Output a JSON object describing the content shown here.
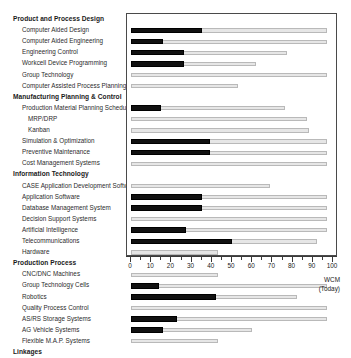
{
  "chart_data": {
    "type": "bar",
    "title": "",
    "xlabel": "WCM (Today)",
    "ylabel": "",
    "xlim": [
      0,
      100
    ],
    "grid": false,
    "legend": "none",
    "axis": {
      "major_ticks": [
        0,
        10,
        20,
        30,
        40,
        50,
        60,
        70,
        80,
        90,
        100
      ],
      "minor_tick_step": 5,
      "tick_labels": [
        "0",
        "10",
        "20",
        "30",
        "40",
        "50",
        "60",
        "70",
        "80",
        "90",
        "100"
      ]
    },
    "series": [
      {
        "name": "current",
        "color": "#111111"
      },
      {
        "name": "target",
        "color": "#e6e6e6"
      }
    ],
    "groups": [
      {
        "label": "Product and Process Design",
        "level": "header",
        "current": null,
        "target": null
      },
      {
        "label": "Computer Aided Design",
        "level": "sub",
        "current": 35,
        "target": 97
      },
      {
        "label": "Computer Aided Engineering",
        "level": "sub",
        "current": 16,
        "target": 97
      },
      {
        "label": "Engineering Control",
        "level": "sub",
        "current": 26,
        "target": 77
      },
      {
        "label": "Workcell Device Programming",
        "level": "sub",
        "current": 26,
        "target": 62
      },
      {
        "label": "Group Technology",
        "level": "sub",
        "current": 0,
        "target": 97
      },
      {
        "label": "Computer Assisted Process Planning",
        "level": "sub",
        "current": 0,
        "target": 53
      },
      {
        "label": "Manufacturing Planning & Control",
        "level": "header",
        "current": null,
        "target": null
      },
      {
        "label": "Production Material Planning Scheduling",
        "level": "sub",
        "current": 15,
        "target": 76
      },
      {
        "label": "MRP/DRP",
        "level": "sub2",
        "current": 0,
        "target": 87
      },
      {
        "label": "Kanban",
        "level": "sub2",
        "current": 0,
        "target": 88
      },
      {
        "label": "Simulation & Optimization",
        "level": "sub",
        "current": 39,
        "target": 97
      },
      {
        "label": "Preventive Maintenance",
        "level": "sub",
        "current": 39,
        "target": 97
      },
      {
        "label": "Cost Management Systems",
        "level": "sub",
        "current": 0,
        "target": 97
      },
      {
        "label": "Information Technology",
        "level": "header",
        "current": null,
        "target": null
      },
      {
        "label": "CASE Application Development Software",
        "level": "sub",
        "current": 0,
        "target": 69
      },
      {
        "label": "Application Software",
        "level": "sub",
        "current": 35,
        "target": 97
      },
      {
        "label": "Database Management System",
        "level": "sub",
        "current": 35,
        "target": 97
      },
      {
        "label": "Decision Support Systems",
        "level": "sub",
        "current": 0,
        "target": 97
      },
      {
        "label": "Artificial Intelligence",
        "level": "sub",
        "current": 27,
        "target": 97
      },
      {
        "label": "Telecommunications",
        "level": "sub",
        "current": 50,
        "target": 92
      },
      {
        "label": "Hardware",
        "level": "sub",
        "current": 0,
        "target": 43
      },
      {
        "label": "Production Process",
        "level": "header",
        "current": null,
        "target": null
      },
      {
        "label": "CNC/DNC Machines",
        "level": "sub",
        "current": 0,
        "target": 43
      },
      {
        "label": "Group Technology Cells",
        "level": "sub",
        "current": 14,
        "target": 97
      },
      {
        "label": "Robotics",
        "level": "sub",
        "current": 42,
        "target": 82
      },
      {
        "label": "Quality Process Control",
        "level": "sub",
        "current": 0,
        "target": 97
      },
      {
        "label": "AS/RS Storage Systems",
        "level": "sub",
        "current": 23,
        "target": 97
      },
      {
        "label": "AG Vehicle Systems",
        "level": "sub",
        "current": 16,
        "target": 60
      },
      {
        "label": "Flexible M.A.P. Systems",
        "level": "sub",
        "current": 0,
        "target": 43
      },
      {
        "label": "Linkages",
        "level": "header",
        "current": null,
        "target": null
      }
    ]
  },
  "footer": {
    "line1": "WCM",
    "line2": "(Today)"
  }
}
